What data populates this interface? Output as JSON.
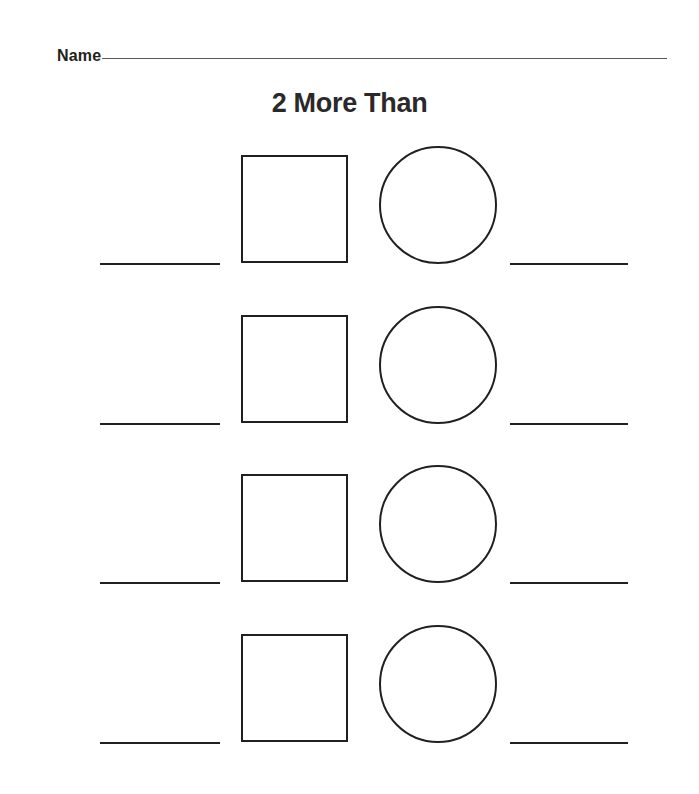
{
  "page": {
    "background_color": "#ffffff",
    "width": 699,
    "height": 794,
    "ink_color": "#231f20",
    "rule_color": "#5a5a5a"
  },
  "header": {
    "name_label": "Name",
    "name_value": "",
    "name_placeholder": ""
  },
  "title": {
    "text": "2 More Than"
  },
  "worksheet": {
    "row_count": 4,
    "rows": [
      {
        "index": 1,
        "left_answer": "",
        "square_value": "",
        "circle_value": "",
        "right_answer": ""
      },
      {
        "index": 2,
        "left_answer": "",
        "square_value": "",
        "circle_value": "",
        "right_answer": ""
      },
      {
        "index": 3,
        "left_answer": "",
        "square_value": "",
        "circle_value": "",
        "right_answer": ""
      },
      {
        "index": 4,
        "left_answer": "",
        "square_value": "",
        "circle_value": "",
        "right_answer": ""
      }
    ]
  }
}
